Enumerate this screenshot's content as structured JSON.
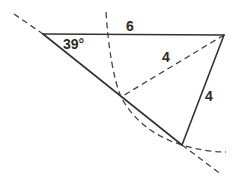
{
  "diagram": {
    "type": "geometry-ambiguous-case-triangle",
    "labels": {
      "angle": "39°",
      "top_side": "6",
      "dashed_side": "4",
      "right_side": "4"
    },
    "points": {
      "A": [
        43,
        34
      ],
      "C": [
        224,
        35
      ],
      "B1": [
        121,
        97
      ],
      "B2": [
        182,
        145
      ]
    },
    "colors": {
      "stroke": "#333333",
      "dash": "#444444",
      "text": "#2a2a2a",
      "background": "#ffffff"
    }
  }
}
